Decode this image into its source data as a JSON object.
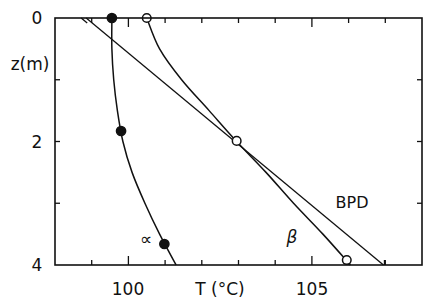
{
  "chart_data": {
    "type": "line",
    "title": "",
    "xlabel": "T (°C)",
    "ylabel": "z(m)",
    "xlim": [
      98,
      108
    ],
    "ylim": [
      0,
      4
    ],
    "y_inverted": true,
    "grid": false,
    "x_major_ticks": [
      100,
      105
    ],
    "x_tick_labels": [
      "100",
      "105"
    ],
    "x_minor_step": 1,
    "y_major_ticks": [
      0,
      2,
      4
    ],
    "y_tick_labels": [
      "0",
      "2",
      "4"
    ],
    "y_minor_ticks": [
      1,
      3
    ],
    "series": [
      {
        "name": "α",
        "label": "∝",
        "marker": "filled-circle",
        "points": [
          {
            "T": 99.55,
            "z": 0.0
          },
          {
            "T": 99.8,
            "z": 1.83
          },
          {
            "T": 100.98,
            "z": 3.66
          }
        ],
        "curve": [
          {
            "T": 99.55,
            "z": 0.0
          },
          {
            "T": 99.55,
            "z": 0.5
          },
          {
            "T": 99.6,
            "z": 1.0
          },
          {
            "T": 99.7,
            "z": 1.5
          },
          {
            "T": 99.85,
            "z": 2.0
          },
          {
            "T": 100.1,
            "z": 2.5
          },
          {
            "T": 100.45,
            "z": 3.0
          },
          {
            "T": 100.85,
            "z": 3.5
          },
          {
            "T": 101.3,
            "z": 4.0
          }
        ],
        "label_pos": {
          "T": 100.5,
          "z": 3.55
        }
      },
      {
        "name": "β",
        "label": "β",
        "marker": "open-circle",
        "points": [
          {
            "T": 100.5,
            "z": 0.0
          },
          {
            "T": 102.95,
            "z": 1.99
          },
          {
            "T": 105.95,
            "z": 3.92
          }
        ],
        "curve": [
          {
            "T": 100.5,
            "z": 0.0
          },
          {
            "T": 100.85,
            "z": 0.5
          },
          {
            "T": 101.45,
            "z": 1.0
          },
          {
            "T": 102.2,
            "z": 1.5
          },
          {
            "T": 102.95,
            "z": 2.0
          },
          {
            "T": 103.75,
            "z": 2.5
          },
          {
            "T": 104.5,
            "z": 3.0
          },
          {
            "T": 105.3,
            "z": 3.5
          },
          {
            "T": 106.05,
            "z": 4.0
          }
        ],
        "label_pos": {
          "T": 104.5,
          "z": 3.55
        }
      },
      {
        "name": "BPD",
        "label": "BPD",
        "marker": "none",
        "points": [],
        "curve": [
          {
            "T": 98.85,
            "z": 0.0
          },
          {
            "T": 106.95,
            "z": 4.0
          }
        ],
        "label_pos": {
          "T": 105.7,
          "z": 3.0
        }
      }
    ]
  },
  "labels": {
    "y_axis": "z(m)",
    "x_axis": "T (°C)",
    "y_tick_0": "0",
    "y_tick_2": "2",
    "y_tick_4": "4",
    "x_tick_100": "100",
    "x_tick_105": "105",
    "alpha": "∝",
    "beta": "β",
    "bpd": "BPD"
  }
}
